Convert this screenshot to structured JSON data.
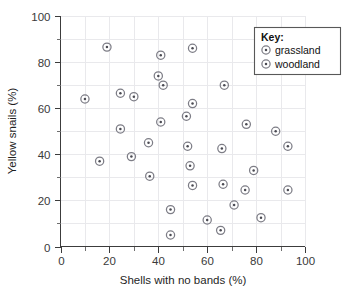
{
  "chart_data": {
    "type": "scatter",
    "title": "",
    "xlabel": "Shells with no bands (%)",
    "ylabel": "Yellow snails (%)",
    "xlim": [
      0,
      100
    ],
    "ylim": [
      0,
      100
    ],
    "x_ticks": [
      0,
      20,
      40,
      60,
      80,
      100
    ],
    "y_ticks": [
      0,
      20,
      40,
      60,
      80,
      100
    ],
    "x_minor_step": 10,
    "y_minor_step": 10,
    "grid": true,
    "grid_step": 10,
    "legend_position": "top-right",
    "legend_title": "Key:",
    "marker_style": "open circle with centre dot",
    "series": [
      {
        "name": "grassland",
        "marker": "circle-dot",
        "points": [
          [
            19,
            86.5
          ],
          [
            41,
            83
          ],
          [
            54,
            86
          ],
          [
            40,
            74
          ],
          [
            42,
            70
          ],
          [
            67,
            70
          ],
          [
            24.5,
            66.5
          ],
          [
            30,
            65
          ],
          [
            10,
            64
          ],
          [
            54,
            62
          ],
          [
            51.5,
            56.5
          ],
          [
            41,
            54
          ]
        ]
      },
      {
        "name": "woodland",
        "marker": "circle-dot",
        "points": [
          [
            76,
            53
          ],
          [
            88,
            50
          ],
          [
            24.5,
            51
          ],
          [
            36,
            45
          ],
          [
            52,
            43.5
          ],
          [
            66,
            42.5
          ],
          [
            93,
            43.5
          ],
          [
            29,
            39
          ],
          [
            16,
            37
          ],
          [
            53,
            35
          ],
          [
            79,
            33
          ],
          [
            36.5,
            30.5
          ],
          [
            66.5,
            27
          ],
          [
            54,
            26.5
          ],
          [
            75.5,
            24.5
          ],
          [
            93,
            24.5
          ],
          [
            71,
            18
          ],
          [
            45,
            16
          ],
          [
            82,
            12.5
          ],
          [
            60,
            11.5
          ],
          [
            65.5,
            7
          ],
          [
            45,
            5
          ]
        ]
      }
    ],
    "legend_entries": [
      {
        "label": "grassland",
        "marker": "circle-dot"
      },
      {
        "label": "woodland",
        "marker": "circle-dot"
      }
    ]
  },
  "colors": {
    "background": "#ffffff",
    "grid": "#e9e9ec",
    "axis": "#3c3c3c",
    "marker_ring": "#7d7d86",
    "marker_dot": "#4a4a52",
    "legend_border": "#585858",
    "text": "#1f1f1f"
  }
}
